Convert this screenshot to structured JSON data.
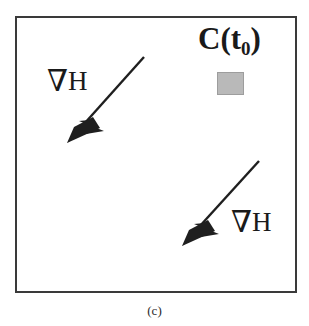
{
  "figure": {
    "caption": "(c)",
    "background_color": "#ffffff",
    "frame": {
      "border_color": "#3a3a3a",
      "border_width_px": 2,
      "x": 15,
      "y": 16,
      "width": 282,
      "height": 277
    },
    "region_label": {
      "text_main": "C(t",
      "text_subscript": "0",
      "text_close": ")",
      "full_text": "C(t0)",
      "color": "#1a1a1a"
    },
    "region_swatch": {
      "fill_color": "#b9b9b9",
      "stroke_color": "#9d9d9d",
      "x": 217,
      "y": 72,
      "width": 27,
      "height": 23
    },
    "gradient_arrows": [
      {
        "label_nabla": "∇",
        "label_field": "H",
        "label_full": "∇H",
        "tail_x": 144,
        "tail_y": 57,
        "tip_x": 67,
        "tip_y": 143,
        "color": "#1f1f1f"
      },
      {
        "label_nabla": "∇",
        "label_field": "H",
        "label_full": "∇H",
        "tail_x": 259,
        "tail_y": 161,
        "tip_x": 182,
        "tip_y": 246,
        "color": "#1f1f1f"
      }
    ]
  }
}
